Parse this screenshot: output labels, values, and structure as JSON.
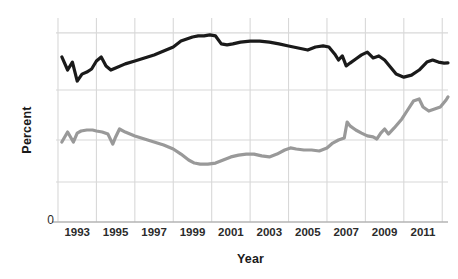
{
  "chart_data": {
    "type": "line",
    "title": "",
    "xlabel": "Year",
    "ylabel": "Percent",
    "xlim": [
      1992.0,
      2012.3
    ],
    "ylim": [
      0,
      100
    ],
    "grid": true,
    "legend": "none",
    "xticks": [
      "1993",
      "1995",
      "1997",
      "1999",
      "2001",
      "2003",
      "2005",
      "2007",
      "2009",
      "2011"
    ],
    "xtick_values": [
      1993,
      1995,
      1997,
      1999,
      2001,
      2003,
      2005,
      2007,
      2009,
      2011
    ],
    "yticks": [
      "0"
    ],
    "ytick_values": [
      0
    ],
    "gridline_y_values": [
      92.7,
      64.7,
      40.2,
      19.6
    ],
    "series": [
      {
        "name": "upper-series",
        "color": "#1a1a1a",
        "width": 3.2,
        "x": [
          1992.2,
          1992.5,
          1992.75,
          1993.0,
          1993.25,
          1993.5,
          1993.75,
          1994.0,
          1994.25,
          1994.5,
          1994.75,
          1995.0,
          1995.5,
          1996.0,
          1996.5,
          1997.0,
          1997.5,
          1998.0,
          1998.4,
          1998.7,
          1999.0,
          1999.3,
          1999.6,
          1999.9,
          2000.2,
          2000.5,
          2000.8,
          2001.1,
          2001.5,
          2002.0,
          2002.5,
          2003.0,
          2003.5,
          2004.0,
          2004.5,
          2005.0,
          2005.4,
          2005.8,
          2006.1,
          2006.4,
          2006.6,
          2006.8,
          2007.0,
          2007.2,
          2007.5,
          2007.8,
          2008.1,
          2008.4,
          2008.7,
          2009.0,
          2009.3,
          2009.6,
          2010.0,
          2010.4,
          2010.8,
          2011.2,
          2011.5,
          2011.8,
          2012.1,
          2012.3
        ],
        "y": [
          80.9,
          74.5,
          78.4,
          69.1,
          72.5,
          73.5,
          75.0,
          78.9,
          80.9,
          76.5,
          74.5,
          75.5,
          77.5,
          78.9,
          80.4,
          81.9,
          83.8,
          85.8,
          88.7,
          89.7,
          90.7,
          91.2,
          91.2,
          91.7,
          91.2,
          87.3,
          86.8,
          87.3,
          88.2,
          88.7,
          88.7,
          88.2,
          87.3,
          86.3,
          85.3,
          84.3,
          85.8,
          86.3,
          85.8,
          82.4,
          79.4,
          81.4,
          76.5,
          77.9,
          79.9,
          81.9,
          83.3,
          80.4,
          81.4,
          79.4,
          76.0,
          72.5,
          71.0,
          72.0,
          74.5,
          78.4,
          79.4,
          78.4,
          77.9,
          78.0
        ]
      },
      {
        "name": "lower-series",
        "color": "#999999",
        "width": 3.2,
        "x": [
          1992.2,
          1992.5,
          1992.8,
          1993.0,
          1993.2,
          1993.5,
          1993.8,
          1994.0,
          1994.3,
          1994.6,
          1994.85,
          1995.0,
          1995.2,
          1995.5,
          1996.0,
          1996.5,
          1997.0,
          1997.5,
          1998.0,
          1998.4,
          1998.8,
          1999.1,
          1999.4,
          1999.8,
          2000.2,
          2000.6,
          2001.0,
          2001.4,
          2001.8,
          2002.2,
          2002.6,
          2003.0,
          2003.4,
          2003.8,
          2004.1,
          2004.4,
          2004.8,
          2005.2,
          2005.6,
          2006.0,
          2006.3,
          2006.6,
          2006.9,
          2007.05,
          2007.2,
          2007.5,
          2007.8,
          2008.1,
          2008.4,
          2008.6,
          2008.8,
          2009.0,
          2009.2,
          2009.5,
          2009.9,
          2010.2,
          2010.5,
          2010.8,
          2011.0,
          2011.3,
          2011.6,
          2011.9,
          2012.2,
          2012.3
        ],
        "y": [
          39.2,
          44.1,
          39.2,
          43.6,
          44.6,
          45.1,
          45.1,
          44.6,
          44.1,
          43.1,
          38.2,
          41.7,
          45.6,
          44.1,
          42.2,
          40.7,
          39.2,
          37.7,
          35.8,
          33.3,
          30.4,
          28.9,
          28.4,
          28.4,
          28.9,
          30.4,
          31.9,
          32.8,
          33.3,
          33.3,
          32.4,
          31.9,
          33.3,
          35.3,
          36.3,
          35.8,
          35.3,
          35.3,
          34.8,
          36.3,
          38.7,
          40.2,
          41.2,
          49.0,
          47.1,
          45.1,
          43.6,
          42.2,
          41.7,
          40.7,
          43.6,
          45.6,
          43.1,
          46.1,
          50.5,
          54.9,
          59.3,
          60.3,
          56.4,
          54.4,
          55.4,
          56.4,
          59.8,
          61.3
        ]
      }
    ]
  }
}
